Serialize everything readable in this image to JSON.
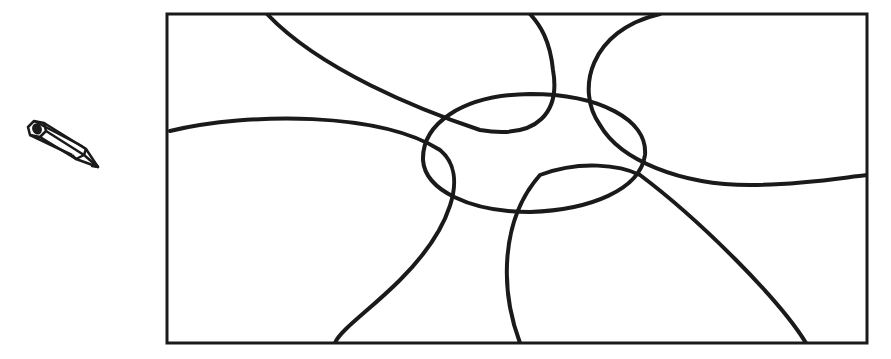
{
  "icons": {
    "pencil": "pencil-icon"
  },
  "figure": {
    "frame": {
      "x": 167,
      "y": 14,
      "width": 700,
      "height": 329
    },
    "stroke_color": "#1a1a1a",
    "background": "#ffffff",
    "curves": [
      "M 267 14 C 320 70, 420 110, 480 130 C 540 140, 560 110, 553 70 C 550 40, 540 25, 530 14",
      "M 170 131 C 250 112, 380 112, 440 150 C 470 175, 450 230, 400 280 C 370 310, 340 330, 335 343",
      "M 660 14 C 590 30, 575 90, 600 125 C 620 160, 680 185, 750 185 C 800 185, 840 178, 867 175",
      "M 520 343 C 500 290, 500 220, 540 175 C 580 160, 620 165, 640 175 C 700 220, 780 300, 806 343",
      "M 530 94 C 600 94, 648 120, 645 155 C 640 190, 590 210, 530 212 C 470 212, 425 190, 423 160 C 422 125, 460 95, 530 94 Z"
    ]
  }
}
